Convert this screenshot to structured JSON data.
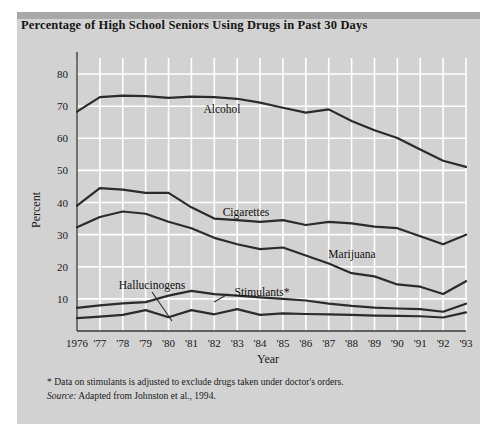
{
  "panel": {
    "title": "Percentage of High School Seniors Using Drugs in Past 30 Days",
    "background_color": "#d2d2d2",
    "topbar_color": "#a8a8a8",
    "page_color": "#ffffff",
    "line_color": "#2b2b2b",
    "gridline_color": "#ffffff"
  },
  "footnote": {
    "asterisk_note": "* Data on stimulants is adjusted to exclude drugs taken under doctor's orders.",
    "source_label": "Source:",
    "source_text": " Adapted from Johnston et al., 1994."
  },
  "chart_data": {
    "type": "line",
    "title": "Percentage of High School Seniors Using Drugs in Past 30 Days",
    "xlabel": "Year",
    "ylabel": "Percent",
    "xlim": [
      1976,
      1993
    ],
    "ylim": [
      0,
      85
    ],
    "yticks": [
      10,
      20,
      30,
      40,
      50,
      60,
      70,
      80
    ],
    "ytick_labels": [
      "10",
      "20",
      "30",
      "40",
      "50",
      "60",
      "70",
      "80"
    ],
    "grid": true,
    "legend": "inline-labels",
    "x": [
      1976,
      1977,
      1978,
      1979,
      1980,
      1981,
      1982,
      1983,
      1984,
      1985,
      1986,
      1987,
      1988,
      1989,
      1990,
      1991,
      1992,
      1993
    ],
    "xtick_labels": [
      "1976",
      "'77",
      "'78",
      "'79",
      "'80",
      "'81",
      "'82",
      "'83",
      "'84",
      "'85",
      "'86",
      "'87",
      "'88",
      "'89",
      "'90",
      "'91",
      "'92",
      "'93"
    ],
    "series": [
      {
        "name": "Alcohol",
        "label": "Alcohol",
        "values": [
          68.3,
          72.8,
          73.3,
          73.1,
          72.6,
          73.0,
          72.8,
          72.3,
          71.1,
          69.5,
          68.0,
          69.0,
          65.4,
          62.5,
          60.1,
          56.5,
          53.0,
          51.1
        ]
      },
      {
        "name": "Cigarettes",
        "label": "Cigarettes",
        "values": [
          39.0,
          44.5,
          44.0,
          43.0,
          43.0,
          38.5,
          35.0,
          34.5,
          34.0,
          34.5,
          33.0,
          34.0,
          33.5,
          32.5,
          32.0,
          29.5,
          27.0,
          30.0
        ]
      },
      {
        "name": "Marijuana",
        "label": "Marijuana",
        "values": [
          32.3,
          35.5,
          37.2,
          36.5,
          34.0,
          32.0,
          29.0,
          27.0,
          25.5,
          26.0,
          23.5,
          21.0,
          18.0,
          17.0,
          14.5,
          13.8,
          11.5,
          15.5
        ]
      },
      {
        "name": "Stimulants",
        "label": "Stimulants*",
        "values": [
          7.2,
          8.0,
          8.6,
          9.0,
          11.0,
          12.5,
          11.5,
          11.0,
          10.5,
          10.0,
          9.5,
          8.5,
          7.8,
          7.3,
          7.0,
          6.8,
          6.0,
          8.5
        ]
      },
      {
        "name": "Hallucinogens",
        "label": "Hallucinogens",
        "values": [
          4.0,
          4.5,
          5.0,
          6.5,
          4.3,
          6.5,
          5.2,
          6.8,
          5.0,
          5.5,
          5.3,
          5.2,
          5.0,
          4.8,
          4.7,
          4.6,
          4.2,
          5.8
        ]
      }
    ]
  }
}
